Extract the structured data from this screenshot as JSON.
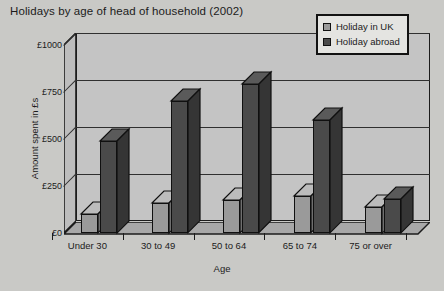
{
  "chart_data": {
    "type": "bar",
    "title": "Holidays by age of head of household (2002)",
    "xlabel": "Age",
    "ylabel": "Amount spent in £s",
    "categories": [
      "Under 30",
      "30 to 49",
      "50 to 64",
      "65 to 74",
      "75 or over"
    ],
    "series": [
      {
        "name": "Holiday in UK",
        "color": "#9a9a9a",
        "values": [
          100,
          160,
          175,
          195,
          140
        ]
      },
      {
        "name": "Holiday abroad",
        "color": "#4a4a4a",
        "values": [
          490,
          700,
          790,
          600,
          180
        ]
      }
    ],
    "ylim": [
      0,
      1000
    ],
    "yticks": [
      0,
      250,
      500,
      750,
      1000
    ],
    "ytick_labels": [
      "£0",
      "£250",
      "£500",
      "£750",
      "£1000"
    ],
    "grid": true,
    "legend_position": "top-right",
    "style": "3d-column"
  },
  "legend": {
    "items": [
      {
        "label": "Holiday in UK"
      },
      {
        "label": "Holiday abroad"
      }
    ]
  },
  "colors": {
    "page_background": "#c9c9c6",
    "plot_background": "#c4c4c4",
    "axis": "#1b1b1b",
    "gridline": "#303030",
    "legend_background": "#e4e4e1",
    "uk_bar": "#9a9a9a",
    "abroad_bar": "#4a4a4a"
  }
}
